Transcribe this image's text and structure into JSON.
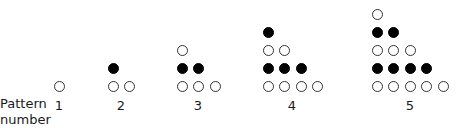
{
  "axis_label": {
    "line1": "Pattern",
    "line2": "number"
  },
  "patterns": [
    {
      "number": "1",
      "x0": 59,
      "label_x": 59,
      "rows": [
        [
          "open"
        ]
      ]
    },
    {
      "number": "2",
      "x0": 113,
      "label_x": 121,
      "rows": [
        [
          "filled"
        ],
        [
          "open",
          "open"
        ]
      ]
    },
    {
      "number": "3",
      "x0": 182,
      "label_x": 198,
      "rows": [
        [
          "open"
        ],
        [
          "filled",
          "filled"
        ],
        [
          "open",
          "open",
          "open"
        ]
      ]
    },
    {
      "number": "4",
      "x0": 268,
      "label_x": 292,
      "rows": [
        [
          "filled"
        ],
        [
          "open",
          "open"
        ],
        [
          "filled",
          "filled",
          "filled"
        ],
        [
          "open",
          "open",
          "open",
          "open"
        ]
      ]
    },
    {
      "number": "5",
      "x0": 377,
      "label_x": 410,
      "rows": [
        [
          "open"
        ],
        [
          "filled",
          "filled"
        ],
        [
          "open",
          "open",
          "open"
        ],
        [
          "filled",
          "filled",
          "filled",
          "filled"
        ],
        [
          "open",
          "open",
          "open",
          "open",
          "open"
        ]
      ]
    }
  ],
  "layout": {
    "bottom_row_y": 86,
    "row_spacing": 18,
    "col_spacing": 16.5,
    "number_y": 98
  },
  "colors": {
    "filled": "#000000",
    "open_stroke": "#333333"
  }
}
